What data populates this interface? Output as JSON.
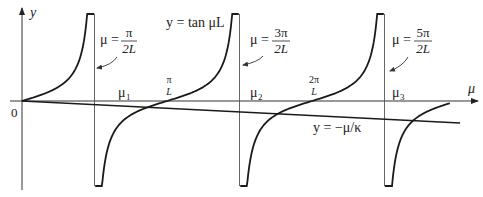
{
  "figure": {
    "axes": {
      "x_label": "μ",
      "y_label": "y",
      "origin_label": "0"
    },
    "curves": {
      "tan_label": "y = tan μL",
      "line_label": "y = −μ/κ"
    },
    "asymptotes": [
      {
        "mu_label": "μ =",
        "num": "π",
        "den": "2L",
        "multiple_of_pi_over_2L": 1
      },
      {
        "mu_label": "μ =",
        "num": "3π",
        "den": "2L",
        "multiple_of_pi_over_2L": 3
      },
      {
        "mu_label": "μ =",
        "num": "5π",
        "den": "2L",
        "multiple_of_pi_over_2L": 5
      }
    ],
    "ticks": [
      {
        "num": "π",
        "den": "L",
        "multiple_of_pi_over_L": 1
      },
      {
        "num": "2π",
        "den": "L",
        "multiple_of_pi_over_L": 2
      }
    ],
    "roots": [
      {
        "label": "μ",
        "sub": "1"
      },
      {
        "label": "μ",
        "sub": "2"
      },
      {
        "label": "μ",
        "sub": "3"
      }
    ],
    "colors": {
      "curve": "#1a1a1a",
      "axis": "#333333",
      "asymptote": "#555555"
    }
  }
}
